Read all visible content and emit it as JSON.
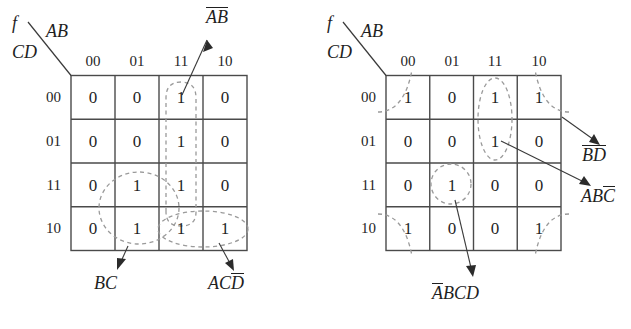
{
  "figure": {
    "type": "karnaugh-map-pair"
  },
  "colors": {
    "grid_line": "#4a4a4a",
    "group_dash": "#9a9a9a",
    "text": "#1f1f1f",
    "leader_line": "#3a3a3a",
    "background": "#ffffff"
  },
  "maps": [
    {
      "id": "left-kmap",
      "function_label": "f",
      "col_var_label": "AB",
      "row_var_label": "CD",
      "col_headers": [
        "00",
        "01",
        "11",
        "10"
      ],
      "row_headers": [
        "00",
        "01",
        "11",
        "10"
      ],
      "cells": [
        [
          "0",
          "0",
          "1",
          "0"
        ],
        [
          "0",
          "0",
          "1",
          "0"
        ],
        [
          "0",
          "1",
          "1",
          "0"
        ],
        [
          "0",
          "1",
          "1",
          "1"
        ]
      ],
      "groups": [
        {
          "name": "group-ab",
          "label_plain": "AB",
          "label_parts": [
            {
              "text": "AB",
              "bar": false
            }
          ],
          "shape": "vertical-column",
          "covers": "column 11, all four rows"
        },
        {
          "name": "group-bc",
          "label_plain": "BC",
          "label_parts": [
            {
              "text": "BC",
              "bar": false
            }
          ],
          "shape": "vertical-pair-ellipse",
          "covers": "column 01, rows 11 and 10"
        },
        {
          "name": "group-acd",
          "label_plain": "ACD'",
          "label_parts": [
            {
              "text": "AC",
              "bar": false
            },
            {
              "text": "D",
              "bar": true
            }
          ],
          "shape": "horizontal-pair-ellipse",
          "covers": "row 10, columns 11 and 10"
        }
      ]
    },
    {
      "id": "right-kmap",
      "function_label": "f",
      "col_var_label": "AB",
      "row_var_label": "CD",
      "col_headers": [
        "00",
        "01",
        "11",
        "10"
      ],
      "row_headers": [
        "00",
        "01",
        "11",
        "10"
      ],
      "cells": [
        [
          "1",
          "0",
          "1",
          "1"
        ],
        [
          "0",
          "0",
          "1",
          "0"
        ],
        [
          "0",
          "1",
          "0",
          "0"
        ],
        [
          "1",
          "0",
          "0",
          "1"
        ]
      ],
      "groups": [
        {
          "name": "group-bd",
          "label_plain": "B'D'",
          "label_parts": [
            {
              "text": "B",
              "bar": true
            },
            {
              "text": "D",
              "bar": true
            }
          ],
          "shape": "four-corners",
          "covers": "corner cells (00,00) (00,10) (10,00) (10,10)"
        },
        {
          "name": "group-abc",
          "label_plain": "ABC'",
          "label_parts": [
            {
              "text": "AB",
              "bar": false
            },
            {
              "text": "C",
              "bar": true
            }
          ],
          "shape": "vertical-pair-ellipse",
          "covers": "column 11, rows 00 and 01"
        },
        {
          "name": "group-abcd",
          "label_plain": "A'BCD",
          "label_parts": [
            {
              "text": "A",
              "bar": true
            },
            {
              "text": "BCD",
              "bar": false
            }
          ],
          "shape": "single-cell-circle",
          "covers": "column 01, row 11"
        }
      ]
    }
  ]
}
